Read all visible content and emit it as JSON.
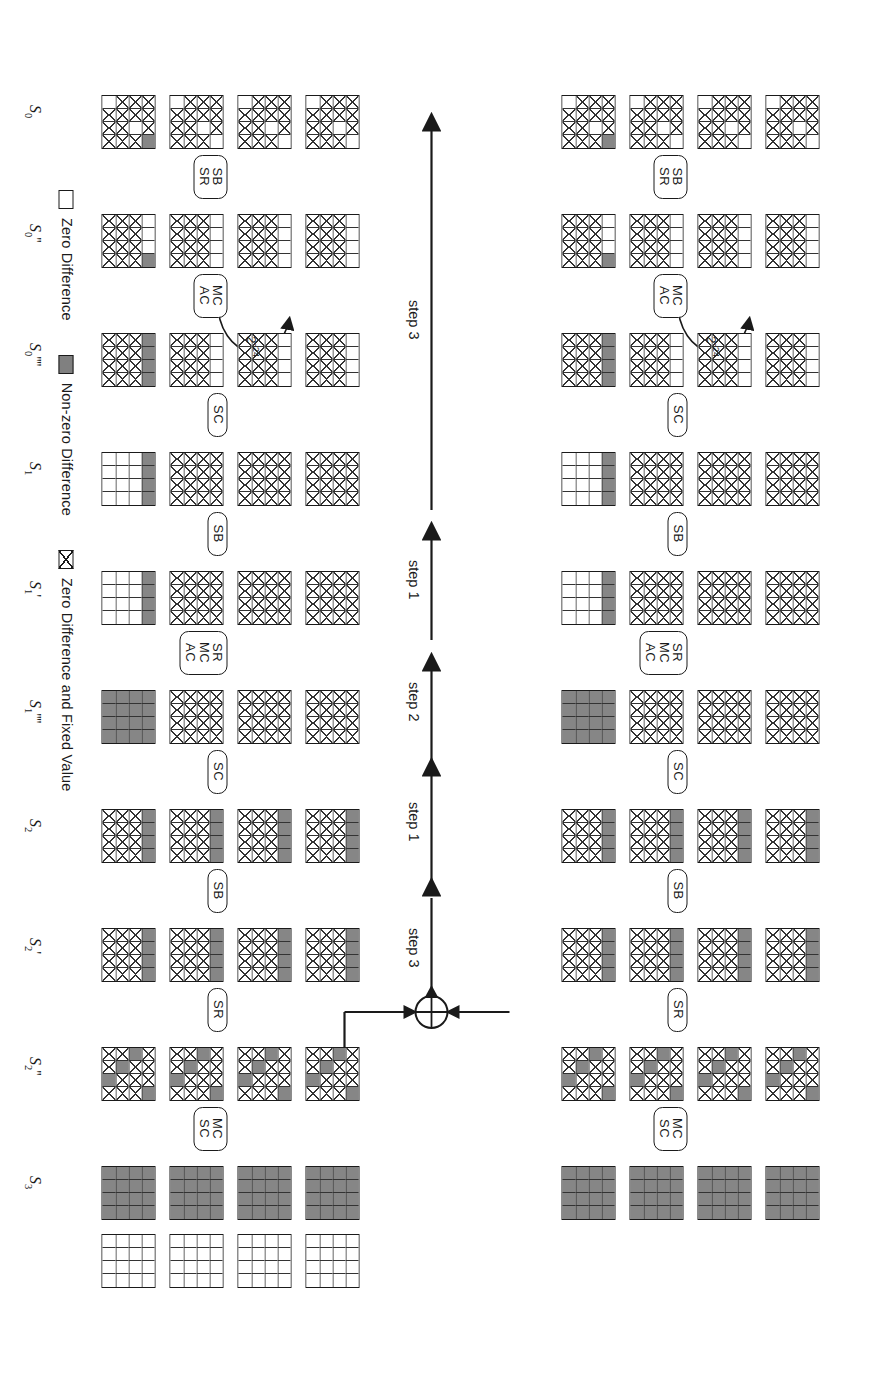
{
  "figure": {
    "legend": {
      "items": [
        {
          "swatch": "white-square-icon",
          "label": "Zero Difference"
        },
        {
          "swatch": "gray-square-icon",
          "label": "Non-zero Difference"
        },
        {
          "swatch": "crossed-square-icon",
          "label": "Zero Difference and Fixed Value"
        }
      ]
    },
    "colors": {
      "nonzero_difference": "#868686",
      "zero_difference": "#ffffff",
      "stroke": "#1a1a1a"
    },
    "probability_annotations": [
      {
        "text": "2",
        "exp": "-24",
        "id": "prob-top"
      },
      {
        "text": "2",
        "exp": "-24",
        "id": "prob-bottom"
      }
    ],
    "steps": [
      {
        "label": "step 3",
        "id": "step-3-upper"
      },
      {
        "label": "step 1",
        "id": "step-1-upper"
      },
      {
        "label": "step 2",
        "id": "step-2-mid"
      },
      {
        "label": "step 1",
        "id": "step-1-lower"
      },
      {
        "label": "step 3",
        "id": "step-3-lower"
      }
    ],
    "xor_symbol": "xor-circle-icon",
    "empty_row_label": "",
    "rows": [
      {
        "id": "row-S0",
        "label": "S",
        "sub": "0",
        "primes": "",
        "op_below": [
          "SB",
          "SR"
        ],
        "grids": [
          [
            "x",
            "x",
            "x",
            "o",
            "x",
            "x",
            "o",
            "x",
            "x",
            "x",
            "x",
            "x",
            "o",
            "x",
            "x",
            "x"
          ],
          [
            "x",
            "x",
            "x",
            "o",
            "x",
            "x",
            "o",
            "x",
            "x",
            "x",
            "x",
            "x",
            "o",
            "x",
            "x",
            "x"
          ],
          [
            "x",
            "x",
            "x",
            "o",
            "x",
            "x",
            "o",
            "x",
            "x",
            "x",
            "x",
            "x",
            "o",
            "x",
            "x",
            "x"
          ],
          [
            "x",
            "x",
            "x",
            "g",
            "x",
            "x",
            "o",
            "x",
            "x",
            "x",
            "x",
            "x",
            "o",
            "x",
            "x",
            "x"
          ]
        ]
      },
      {
        "id": "row-S0pp",
        "label": "S",
        "sub": "0",
        "primes": "''",
        "op_below": [
          "MC",
          "AC"
        ],
        "grids": [
          [
            "o",
            "o",
            "o",
            "o",
            "x",
            "x",
            "x",
            "x",
            "x",
            "x",
            "x",
            "x",
            "x",
            "x",
            "x",
            "x"
          ],
          [
            "o",
            "o",
            "o",
            "o",
            "x",
            "x",
            "x",
            "x",
            "x",
            "x",
            "x",
            "x",
            "x",
            "x",
            "x",
            "x"
          ],
          [
            "o",
            "o",
            "o",
            "o",
            "x",
            "x",
            "x",
            "x",
            "x",
            "x",
            "x",
            "x",
            "x",
            "x",
            "x",
            "x"
          ],
          [
            "o",
            "o",
            "o",
            "g",
            "x",
            "x",
            "x",
            "x",
            "x",
            "x",
            "x",
            "x",
            "x",
            "x",
            "x",
            "x"
          ]
        ]
      },
      {
        "id": "row-S0pppp",
        "label": "S",
        "sub": "0",
        "primes": "''''",
        "op_below": [
          "SC"
        ],
        "grids": [
          [
            "o",
            "o",
            "o",
            "o",
            "x",
            "x",
            "x",
            "x",
            "x",
            "x",
            "x",
            "x",
            "x",
            "x",
            "x",
            "x"
          ],
          [
            "o",
            "o",
            "o",
            "o",
            "x",
            "x",
            "x",
            "x",
            "x",
            "x",
            "x",
            "x",
            "x",
            "x",
            "x",
            "x"
          ],
          [
            "o",
            "o",
            "o",
            "o",
            "x",
            "x",
            "x",
            "x",
            "x",
            "x",
            "x",
            "x",
            "x",
            "x",
            "x",
            "x"
          ],
          [
            "g",
            "g",
            "g",
            "g",
            "x",
            "x",
            "x",
            "x",
            "x",
            "x",
            "x",
            "x",
            "x",
            "x",
            "x",
            "x"
          ]
        ]
      },
      {
        "id": "row-S1",
        "label": "S",
        "sub": "1",
        "primes": "",
        "op_below": [
          "SB"
        ],
        "grids": [
          [
            "x",
            "x",
            "x",
            "x",
            "x",
            "x",
            "x",
            "x",
            "x",
            "x",
            "x",
            "x",
            "x",
            "x",
            "x",
            "x"
          ],
          [
            "x",
            "x",
            "x",
            "x",
            "x",
            "x",
            "x",
            "x",
            "x",
            "x",
            "x",
            "x",
            "x",
            "x",
            "x",
            "x"
          ],
          [
            "x",
            "x",
            "x",
            "x",
            "x",
            "x",
            "x",
            "x",
            "x",
            "x",
            "x",
            "x",
            "x",
            "x",
            "x",
            "x"
          ],
          [
            "g",
            "g",
            "g",
            "g",
            "o",
            "o",
            "o",
            "o",
            "o",
            "o",
            "o",
            "o",
            "o",
            "o",
            "o",
            "o"
          ]
        ]
      },
      {
        "id": "row-S1p",
        "label": "S",
        "sub": "1",
        "primes": "'",
        "op_below": [
          "SR",
          "MC",
          "AC"
        ],
        "grids": [
          [
            "x",
            "x",
            "x",
            "x",
            "x",
            "x",
            "x",
            "x",
            "x",
            "x",
            "x",
            "x",
            "x",
            "x",
            "x",
            "x"
          ],
          [
            "x",
            "x",
            "x",
            "x",
            "x",
            "x",
            "x",
            "x",
            "x",
            "x",
            "x",
            "x",
            "x",
            "x",
            "x",
            "x"
          ],
          [
            "x",
            "x",
            "x",
            "x",
            "x",
            "x",
            "x",
            "x",
            "x",
            "x",
            "x",
            "x",
            "x",
            "x",
            "x",
            "x"
          ],
          [
            "g",
            "g",
            "g",
            "g",
            "o",
            "o",
            "o",
            "o",
            "o",
            "o",
            "o",
            "o",
            "o",
            "o",
            "o",
            "o"
          ]
        ]
      },
      {
        "id": "row-S1pppp",
        "label": "S",
        "sub": "1",
        "primes": "''''",
        "op_below": [
          "SC"
        ],
        "grids": [
          [
            "x",
            "x",
            "x",
            "x",
            "x",
            "x",
            "x",
            "x",
            "x",
            "x",
            "x",
            "x",
            "x",
            "x",
            "x",
            "x"
          ],
          [
            "x",
            "x",
            "x",
            "x",
            "x",
            "x",
            "x",
            "x",
            "x",
            "x",
            "x",
            "x",
            "x",
            "x",
            "x",
            "x"
          ],
          [
            "x",
            "x",
            "x",
            "x",
            "x",
            "x",
            "x",
            "x",
            "x",
            "x",
            "x",
            "x",
            "x",
            "x",
            "x",
            "x"
          ],
          [
            "g",
            "g",
            "g",
            "g",
            "g",
            "g",
            "g",
            "g",
            "g",
            "g",
            "g",
            "g",
            "g",
            "g",
            "g",
            "g"
          ]
        ]
      },
      {
        "id": "row-S2",
        "label": "S",
        "sub": "2",
        "primes": "",
        "op_below": [
          "SB"
        ],
        "grids": [
          [
            "g",
            "g",
            "g",
            "g",
            "x",
            "x",
            "x",
            "x",
            "x",
            "x",
            "x",
            "x",
            "x",
            "x",
            "x",
            "x"
          ],
          [
            "g",
            "g",
            "g",
            "g",
            "x",
            "x",
            "x",
            "x",
            "x",
            "x",
            "x",
            "x",
            "x",
            "x",
            "x",
            "x"
          ],
          [
            "g",
            "g",
            "g",
            "g",
            "x",
            "x",
            "x",
            "x",
            "x",
            "x",
            "x",
            "x",
            "x",
            "x",
            "x",
            "x"
          ],
          [
            "g",
            "g",
            "g",
            "g",
            "x",
            "x",
            "x",
            "x",
            "x",
            "x",
            "x",
            "x",
            "x",
            "x",
            "x",
            "x"
          ]
        ]
      },
      {
        "id": "row-S2p",
        "label": "S",
        "sub": "2",
        "primes": "'",
        "op_below": [
          "SR"
        ],
        "grids": [
          [
            "g",
            "g",
            "g",
            "g",
            "x",
            "x",
            "x",
            "x",
            "x",
            "x",
            "x",
            "x",
            "x",
            "x",
            "x",
            "x"
          ],
          [
            "g",
            "g",
            "g",
            "g",
            "x",
            "x",
            "x",
            "x",
            "x",
            "x",
            "x",
            "x",
            "x",
            "x",
            "x",
            "x"
          ],
          [
            "g",
            "g",
            "g",
            "g",
            "x",
            "x",
            "x",
            "x",
            "x",
            "x",
            "x",
            "x",
            "x",
            "x",
            "x",
            "x"
          ],
          [
            "g",
            "g",
            "g",
            "g",
            "x",
            "x",
            "x",
            "x",
            "x",
            "x",
            "x",
            "x",
            "x",
            "x",
            "x",
            "x"
          ]
        ]
      },
      {
        "id": "row-S2pp",
        "label": "S",
        "sub": "2",
        "primes": "''",
        "op_below": [
          "MC",
          "SC"
        ],
        "grids": [
          [
            "x",
            "x",
            "x",
            "g",
            "g",
            "x",
            "x",
            "x",
            "x",
            "g",
            "x",
            "x",
            "x",
            "x",
            "g",
            "x"
          ],
          [
            "x",
            "x",
            "x",
            "g",
            "g",
            "x",
            "x",
            "x",
            "x",
            "g",
            "x",
            "x",
            "x",
            "x",
            "g",
            "x"
          ],
          [
            "x",
            "x",
            "x",
            "g",
            "g",
            "x",
            "x",
            "x",
            "x",
            "g",
            "x",
            "x",
            "x",
            "x",
            "g",
            "x"
          ],
          [
            "x",
            "x",
            "x",
            "g",
            "g",
            "x",
            "x",
            "x",
            "x",
            "g",
            "x",
            "x",
            "x",
            "x",
            "g",
            "x"
          ]
        ]
      },
      {
        "id": "row-S3",
        "label": "S",
        "sub": "3",
        "primes": "",
        "op_below": [],
        "grids": [
          [
            "g",
            "g",
            "g",
            "g",
            "g",
            "g",
            "g",
            "g",
            "g",
            "g",
            "g",
            "g",
            "g",
            "g",
            "g",
            "g"
          ],
          [
            "g",
            "g",
            "g",
            "g",
            "g",
            "g",
            "g",
            "g",
            "g",
            "g",
            "g",
            "g",
            "g",
            "g",
            "g",
            "g"
          ],
          [
            "g",
            "g",
            "g",
            "g",
            "g",
            "g",
            "g",
            "g",
            "g",
            "g",
            "g",
            "g",
            "g",
            "g",
            "g",
            "g"
          ],
          [
            "g",
            "g",
            "g",
            "g",
            "g",
            "g",
            "g",
            "g",
            "g",
            "g",
            "g",
            "g",
            "g",
            "g",
            "g",
            "g"
          ]
        ]
      },
      {
        "id": "row-empty",
        "label": "",
        "sub": "",
        "primes": "",
        "op_below": [],
        "grids": [
          [
            "o",
            "o",
            "o",
            "o",
            "o",
            "o",
            "o",
            "o",
            "o",
            "o",
            "o",
            "o",
            "o",
            "o",
            "o",
            "o"
          ],
          [
            "o",
            "o",
            "o",
            "o",
            "o",
            "o",
            "o",
            "o",
            "o",
            "o",
            "o",
            "o",
            "o",
            "o",
            "o",
            "o"
          ],
          [
            "o",
            "o",
            "o",
            "o",
            "o",
            "o",
            "o",
            "o",
            "o",
            "o",
            "o",
            "o",
            "o",
            "o",
            "o",
            "o"
          ],
          [
            "o",
            "o",
            "o",
            "o",
            "o",
            "o",
            "o",
            "o",
            "o",
            "o",
            "o",
            "o",
            "o",
            "o",
            "o",
            "o"
          ]
        ]
      }
    ]
  }
}
